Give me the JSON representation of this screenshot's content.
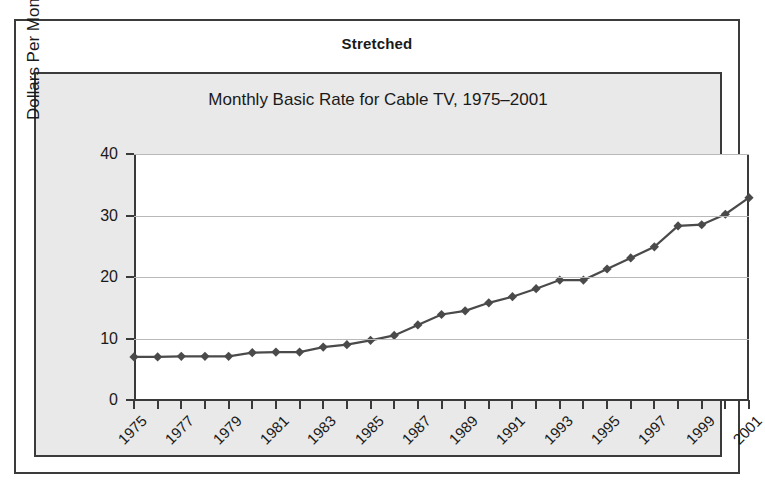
{
  "figure": {
    "caption": "Stretched"
  },
  "chart_data": {
    "type": "line",
    "title": "Monthly Basic Rate for Cable TV, 1975–2001",
    "xlabel": "",
    "ylabel": "Dollars Per Month",
    "grid": "horizontal",
    "legend": "none",
    "xlim": [
      1975,
      2001
    ],
    "ylim": [
      0,
      40
    ],
    "yticks": [
      0,
      10,
      20,
      30,
      40
    ],
    "ytick_labels": [
      "0",
      "10",
      "20",
      "30",
      "40"
    ],
    "xticks": [
      1975,
      1976,
      1977,
      1978,
      1979,
      1980,
      1981,
      1982,
      1983,
      1984,
      1985,
      1986,
      1987,
      1988,
      1989,
      1990,
      1991,
      1992,
      1993,
      1994,
      1995,
      1996,
      1997,
      1998,
      1999,
      2000,
      2001
    ],
    "xtick_labels": [
      "1975",
      "",
      "1977",
      "",
      "1979",
      "",
      "1981",
      "",
      "1983",
      "",
      "1985",
      "",
      "1987",
      "",
      "1989",
      "",
      "1991",
      "",
      "1993",
      "",
      "1995",
      "",
      "1997",
      "",
      "1999",
      "",
      "2001"
    ],
    "marker": "diamond",
    "series_color": "#4a4a4a",
    "x": [
      1975,
      1976,
      1977,
      1978,
      1979,
      1980,
      1981,
      1982,
      1983,
      1984,
      1985,
      1986,
      1987,
      1988,
      1989,
      1990,
      1991,
      1992,
      1993,
      1994,
      1995,
      1996,
      1997,
      1998,
      1999,
      2000,
      2001
    ],
    "values": [
      7.0,
      7.0,
      7.1,
      7.1,
      7.1,
      7.7,
      7.8,
      7.8,
      8.6,
      9.0,
      9.7,
      10.5,
      12.2,
      13.9,
      14.5,
      15.8,
      16.8,
      18.1,
      19.5,
      19.5,
      21.3,
      23.1,
      24.9,
      28.3,
      28.5,
      30.2,
      32.9
    ],
    "series": [
      {
        "name": "Monthly basic rate",
        "values": [
          7.0,
          7.0,
          7.1,
          7.1,
          7.1,
          7.7,
          7.8,
          7.8,
          8.6,
          9.0,
          9.7,
          10.5,
          12.2,
          13.9,
          14.5,
          15.8,
          16.8,
          18.1,
          19.5,
          19.5,
          21.3,
          23.1,
          24.9,
          28.3,
          28.5,
          30.2,
          32.9
        ]
      }
    ]
  },
  "colors": {
    "panel_border": "#3b3b3b",
    "chart_background": "#e9e9e9",
    "plot_background": "#ffffff",
    "gridline": "#b9b9b9",
    "axis": "#3a3a3a",
    "text": "#1a1a1a",
    "series": "#4a4a4a"
  }
}
